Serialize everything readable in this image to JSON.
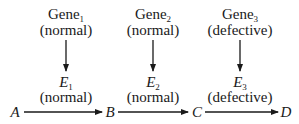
{
  "diagram": {
    "genes": [
      {
        "name": "Gene",
        "sub": "1",
        "status": "(normal)"
      },
      {
        "name": "Gene",
        "sub": "2",
        "status": "(normal)"
      },
      {
        "name": "Gene",
        "sub": "3",
        "status": "(defective)"
      }
    ],
    "enzymes": [
      {
        "name": "E",
        "sub": "1",
        "status": "(normal)"
      },
      {
        "name": "E",
        "sub": "2",
        "status": "(normal)"
      },
      {
        "name": "E",
        "sub": "3",
        "status": "(defective)"
      }
    ],
    "metabolites": [
      "A",
      "B",
      "C",
      "D"
    ]
  }
}
